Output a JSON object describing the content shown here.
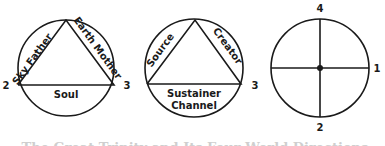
{
  "diagrams": [
    {
      "name": "trinity-soul",
      "sides": {
        "left": "Sky Father",
        "right": "Earth Mother",
        "bottom": "Soul"
      },
      "numbers": {
        "left": "2",
        "right": "3"
      }
    },
    {
      "name": "trinity-creator",
      "sides": {
        "left": "Source",
        "right": "Creator",
        "bottom_line1": "Sustainer",
        "bottom_line2": "Channel"
      },
      "numbers": {
        "left": "3"
      }
    },
    {
      "name": "quaternity-cross",
      "numbers": {
        "top": "4",
        "right": "1",
        "bottom": "2",
        "left": "3"
      }
    }
  ],
  "caption": "The Great Trinity and Its Four World Directions",
  "colors": {
    "stroke": "#1a1a1a",
    "caption": "#cfcfcf"
  }
}
